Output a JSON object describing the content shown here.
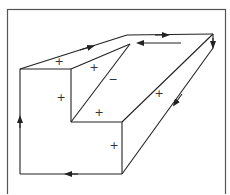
{
  "diagram": {
    "frame": {
      "x": 7,
      "y": 9,
      "width": 219,
      "height": 190,
      "stroke": "#555555"
    },
    "stroke_color": "#222222",
    "vertices": {
      "A": [
        20,
        69
      ],
      "B": [
        71,
        69
      ],
      "C": [
        127,
        35
      ],
      "D": [
        213,
        34
      ],
      "E": [
        130,
        44
      ],
      "F": [
        71,
        122
      ],
      "G": [
        122,
        122
      ],
      "H": [
        213,
        48
      ],
      "I": [
        122,
        174
      ],
      "J": [
        20,
        174
      ]
    },
    "edges": [
      [
        "A",
        "C"
      ],
      [
        "C",
        "D"
      ],
      [
        "D",
        "H"
      ],
      [
        "D",
        "G"
      ],
      [
        "H",
        "I"
      ],
      [
        "I",
        "J"
      ],
      [
        "J",
        "A"
      ],
      [
        "A",
        "B"
      ],
      [
        "B",
        "F"
      ],
      [
        "F",
        "E"
      ],
      [
        "F",
        "G"
      ],
      [
        "G",
        "I"
      ]
    ],
    "arrows": [
      {
        "at": [
          88,
          47
        ],
        "direction": "up-right",
        "edge": "A-C"
      },
      {
        "at": [
          165,
          35
        ],
        "direction": "right",
        "edge": "C-D"
      },
      {
        "at": [
          213,
          44
        ],
        "direction": "down",
        "edge": "D-H"
      },
      {
        "at": [
          176,
          102
        ],
        "direction": "down-left",
        "edge": "H-I"
      },
      {
        "at": [
          70,
          174
        ],
        "direction": "left",
        "edge": "I-J"
      },
      {
        "at": [
          20,
          120
        ],
        "direction": "up",
        "edge": "J-A"
      },
      {
        "from": [
          181,
          43
        ],
        "to": [
          138,
          43
        ],
        "direction": "left",
        "edge": "return"
      }
    ],
    "labels": [
      {
        "text": "+",
        "x": 59,
        "y": 65
      },
      {
        "text": "+",
        "x": 94,
        "y": 71
      },
      {
        "text": "−",
        "x": 113,
        "y": 83
      },
      {
        "text": "+",
        "x": 61,
        "y": 101
      },
      {
        "text": "+",
        "x": 99,
        "y": 116
      },
      {
        "text": "+",
        "x": 114,
        "y": 149
      },
      {
        "text": "+",
        "x": 159,
        "y": 97
      }
    ]
  }
}
